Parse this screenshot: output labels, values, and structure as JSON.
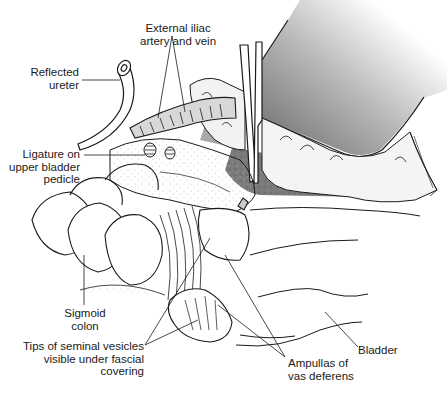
{
  "figure": {
    "colors": {
      "line": "#1a1a1a",
      "retractor_dark": "#6e6e6e",
      "tissue_fill": "#f2f2f2",
      "stipple_gray": "#8a8a8a",
      "deep_field": "#7c7c7c"
    }
  },
  "labels": {
    "external_iliac": {
      "line1": "External iliac",
      "line2": "artery and vein"
    },
    "reflected_ureter": {
      "line1": "Reflected",
      "line2": "ureter"
    },
    "ligature": {
      "line1": "Ligature on",
      "line2": "upper bladder",
      "line3": "pedicle"
    },
    "sigmoid_colon": {
      "line1": "Sigmoid",
      "line2": "colon"
    },
    "seminal_vesicles": {
      "line1": "Tips of seminal vesicles",
      "line2": "visible under fascial",
      "line3": "covering"
    },
    "ampullas": {
      "line1": "Ampullas of",
      "line2": "vas deferens"
    },
    "bladder": {
      "line1": "Bladder"
    }
  }
}
